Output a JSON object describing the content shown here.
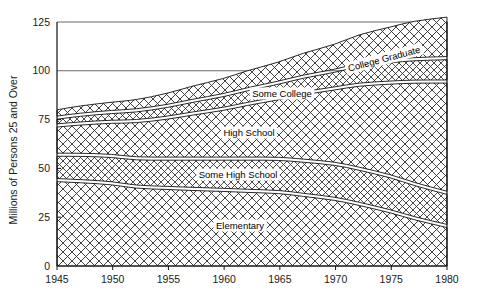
{
  "chart_data": {
    "type": "area",
    "title": "",
    "xlabel": "",
    "ylabel": "Millions of Persons 25 and Over",
    "xlim": [
      1945,
      1980
    ],
    "ylim": [
      0,
      125
    ],
    "grid": true,
    "gridlines": [
      100,
      125
    ],
    "legend": "inline-labels",
    "y_ticks": [
      "0",
      "25",
      "50",
      "75",
      "100",
      "125"
    ],
    "y_tick_values": [
      0,
      25,
      50,
      75,
      100,
      125
    ],
    "x_ticks": [
      "1945",
      "1950",
      "1955",
      "1960",
      "1965",
      "1970",
      "1975",
      "1980"
    ],
    "x_tick_values": [
      1945,
      1950,
      1955,
      1960,
      1965,
      1970,
      1975,
      1980
    ],
    "x": [
      1945,
      1947,
      1950,
      1952,
      1955,
      1957,
      1960,
      1962,
      1965,
      1967,
      1970,
      1972,
      1975,
      1977,
      1980
    ],
    "stacked": true,
    "series": [
      {
        "name": "Elementary",
        "label": "Elementary",
        "values": [
          44.0,
          43.5,
          42.5,
          40.5,
          40.0,
          39.5,
          39.0,
          38.5,
          38.0,
          36.5,
          34.5,
          32.0,
          28.0,
          24.5,
          20.5
        ]
      },
      {
        "name": "Some High School",
        "label": "Some High School",
        "values": [
          13.0,
          13.5,
          14.0,
          14.5,
          15.0,
          15.5,
          16.0,
          16.5,
          17.0,
          17.5,
          18.0,
          18.0,
          18.0,
          17.5,
          17.0
        ]
      },
      {
        "name": "High School",
        "label": "High School",
        "values": [
          15.0,
          16.0,
          17.5,
          19.0,
          21.0,
          23.0,
          25.5,
          28.0,
          31.0,
          34.5,
          38.5,
          43.0,
          48.0,
          52.5,
          57.0
        ]
      },
      {
        "name": "Some College",
        "label": "Some College",
        "values": [
          4.0,
          4.5,
          5.0,
          5.5,
          6.0,
          6.5,
          7.0,
          7.5,
          8.0,
          8.5,
          9.0,
          10.0,
          11.0,
          11.5,
          12.0
        ]
      },
      {
        "name": "College Graduate",
        "label": "College Graduate",
        "values": [
          4.0,
          4.5,
          5.0,
          5.5,
          6.5,
          7.5,
          8.5,
          9.5,
          10.5,
          12.0,
          13.5,
          15.5,
          17.5,
          19.5,
          21.0
        ]
      }
    ]
  },
  "axis": {
    "y_title": "Millions of Persons 25 and Over"
  },
  "colors": {
    "ink": "#1a1a1a",
    "hatch": "#333333",
    "background": "#ffffff",
    "gridline": "#6b6b6b"
  }
}
